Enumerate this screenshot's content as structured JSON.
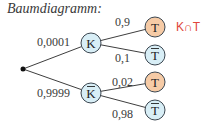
{
  "title": "Baumdiagramm:",
  "colors": {
    "line": "#3e3e3e",
    "node_stroke": "#3b4650",
    "node_blue": "#d8eef6",
    "node_orange": "#f6cba6",
    "label": "#3a3a3a",
    "annotation": "#e0453c"
  },
  "root": {
    "x": 23,
    "y": 69
  },
  "level1": [
    {
      "id": "K",
      "label": "K",
      "overline": false,
      "x": 91,
      "y": 43,
      "prob": "0,0001",
      "prob_x": 37,
      "prob_y": 46,
      "fill": "blue"
    },
    {
      "id": "Kbar",
      "label": "K",
      "overline": true,
      "x": 91,
      "y": 93,
      "prob": "0,9999",
      "prob_x": 37,
      "prob_y": 97,
      "fill": "blue"
    }
  ],
  "level2": [
    {
      "parent": "K",
      "label": "T",
      "overline": false,
      "x": 155,
      "y": 27,
      "prob": "0,9",
      "prob_x": 115,
      "prob_y": 26,
      "fill": "orange"
    },
    {
      "parent": "K",
      "label": "T",
      "overline": true,
      "x": 155,
      "y": 55,
      "prob": "0,1",
      "prob_x": 115,
      "prob_y": 62,
      "fill": "blue"
    },
    {
      "parent": "Kbar",
      "label": "T",
      "overline": false,
      "x": 155,
      "y": 82,
      "prob": "0,02",
      "prob_x": 112,
      "prob_y": 86,
      "fill": "orange"
    },
    {
      "parent": "Kbar",
      "label": "T",
      "overline": true,
      "x": 155,
      "y": 110,
      "prob": "0,98",
      "prob_x": 112,
      "prob_y": 118,
      "fill": "blue"
    }
  ],
  "annotation": {
    "text": "K∩T",
    "x": 176,
    "y": 31
  }
}
